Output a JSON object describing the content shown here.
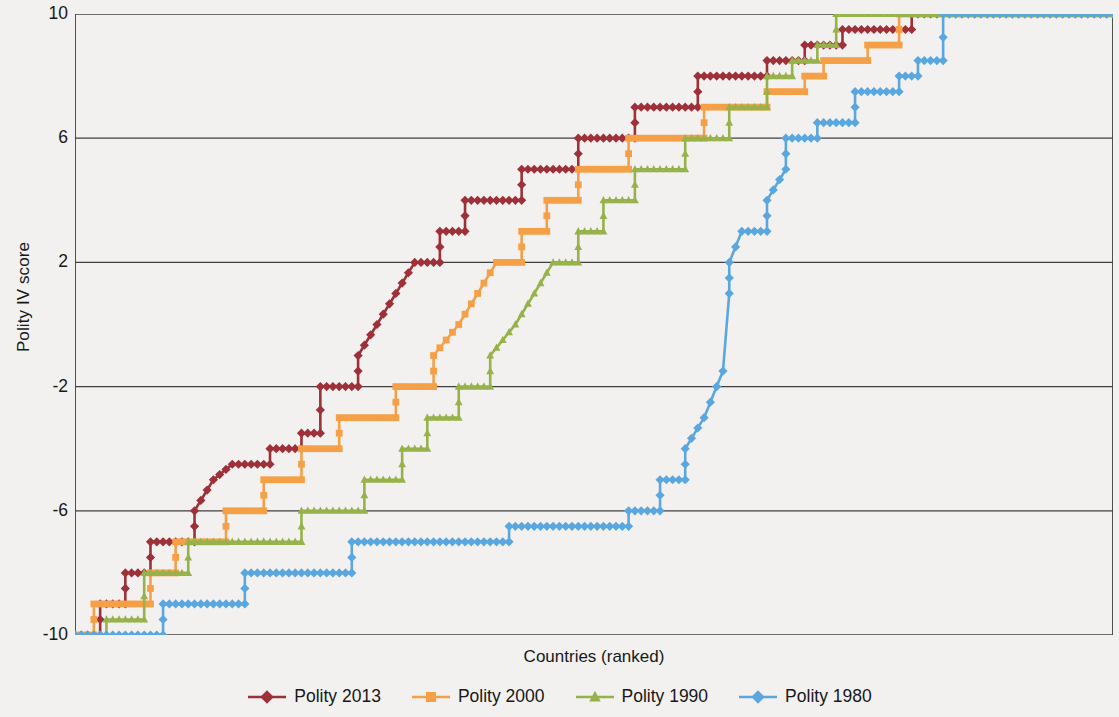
{
  "chart_data": {
    "type": "line",
    "title": "",
    "xlabel": "Countries (ranked)",
    "ylabel": "Polity IV score",
    "ylim": [
      -10,
      10
    ],
    "yticks": [
      10,
      6,
      2,
      -2,
      -6,
      -10
    ],
    "ytick_labels": [
      "10",
      "6",
      "2",
      "-2",
      "-6",
      "-10"
    ],
    "xlim": [
      0,
      165
    ],
    "xticks": [],
    "xtick_labels": [],
    "grid": "horizontal",
    "legend_position": "bottom",
    "note": "Each series is a sorted (ranked) distribution of Polity IV scores across countries; curves are monotonically increasing step functions from -10 to +10.",
    "series": [
      {
        "name": "Polity 2013",
        "color": "#9e3039",
        "marker": "diamond",
        "steps": [
          {
            "x": 0,
            "y": -10
          },
          {
            "x": 4,
            "y": -10
          },
          {
            "x": 4,
            "y": -9
          },
          {
            "x": 8,
            "y": -9
          },
          {
            "x": 8,
            "y": -8
          },
          {
            "x": 12,
            "y": -8
          },
          {
            "x": 12,
            "y": -7
          },
          {
            "x": 19,
            "y": -7
          },
          {
            "x": 19,
            "y": -6
          },
          {
            "x": 22,
            "y": -5
          },
          {
            "x": 25,
            "y": -4.5
          },
          {
            "x": 31,
            "y": -4.5
          },
          {
            "x": 31,
            "y": -4
          },
          {
            "x": 36,
            "y": -4
          },
          {
            "x": 36,
            "y": -3.5
          },
          {
            "x": 39,
            "y": -3.5
          },
          {
            "x": 39,
            "y": -2
          },
          {
            "x": 45,
            "y": -2
          },
          {
            "x": 45,
            "y": -1
          },
          {
            "x": 48,
            "y": 0
          },
          {
            "x": 51,
            "y": 1
          },
          {
            "x": 54,
            "y": 2
          },
          {
            "x": 58,
            "y": 2
          },
          {
            "x": 58,
            "y": 3
          },
          {
            "x": 62,
            "y": 3
          },
          {
            "x": 62,
            "y": 4
          },
          {
            "x": 71,
            "y": 4
          },
          {
            "x": 71,
            "y": 5
          },
          {
            "x": 80,
            "y": 5
          },
          {
            "x": 80,
            "y": 6
          },
          {
            "x": 89,
            "y": 6
          },
          {
            "x": 89,
            "y": 7
          },
          {
            "x": 99,
            "y": 7
          },
          {
            "x": 99,
            "y": 8
          },
          {
            "x": 110,
            "y": 8
          },
          {
            "x": 110,
            "y": 8.5
          },
          {
            "x": 116,
            "y": 8.5
          },
          {
            "x": 116,
            "y": 9
          },
          {
            "x": 122,
            "y": 9
          },
          {
            "x": 122,
            "y": 9.5
          },
          {
            "x": 133,
            "y": 9.5
          },
          {
            "x": 133,
            "y": 10
          },
          {
            "x": 165,
            "y": 10
          }
        ]
      },
      {
        "name": "Polity 2000",
        "color": "#f5a046",
        "marker": "square",
        "steps": [
          {
            "x": 0,
            "y": -10
          },
          {
            "x": 3,
            "y": -10
          },
          {
            "x": 3,
            "y": -9
          },
          {
            "x": 12,
            "y": -9
          },
          {
            "x": 12,
            "y": -8
          },
          {
            "x": 16,
            "y": -8
          },
          {
            "x": 16,
            "y": -7
          },
          {
            "x": 24,
            "y": -7
          },
          {
            "x": 24,
            "y": -6
          },
          {
            "x": 30,
            "y": -6
          },
          {
            "x": 30,
            "y": -5
          },
          {
            "x": 36,
            "y": -5
          },
          {
            "x": 36,
            "y": -4
          },
          {
            "x": 42,
            "y": -4
          },
          {
            "x": 42,
            "y": -3
          },
          {
            "x": 51,
            "y": -3
          },
          {
            "x": 51,
            "y": -2
          },
          {
            "x": 57,
            "y": -2
          },
          {
            "x": 57,
            "y": -1
          },
          {
            "x": 61,
            "y": 0
          },
          {
            "x": 64,
            "y": 1
          },
          {
            "x": 67,
            "y": 2
          },
          {
            "x": 71,
            "y": 2
          },
          {
            "x": 71,
            "y": 3
          },
          {
            "x": 75,
            "y": 3
          },
          {
            "x": 75,
            "y": 4
          },
          {
            "x": 80,
            "y": 4
          },
          {
            "x": 80,
            "y": 5
          },
          {
            "x": 88,
            "y": 5
          },
          {
            "x": 88,
            "y": 6
          },
          {
            "x": 100,
            "y": 6
          },
          {
            "x": 100,
            "y": 7
          },
          {
            "x": 110,
            "y": 7
          },
          {
            "x": 110,
            "y": 7.5
          },
          {
            "x": 116,
            "y": 7.5
          },
          {
            "x": 116,
            "y": 8
          },
          {
            "x": 119,
            "y": 8
          },
          {
            "x": 119,
            "y": 8.5
          },
          {
            "x": 126,
            "y": 8.5
          },
          {
            "x": 126,
            "y": 9
          },
          {
            "x": 131,
            "y": 9
          },
          {
            "x": 131,
            "y": 10
          },
          {
            "x": 165,
            "y": 10
          }
        ]
      },
      {
        "name": "Polity 1990",
        "color": "#97b24b",
        "marker": "triangle",
        "steps": [
          {
            "x": 0,
            "y": -10
          },
          {
            "x": 5,
            "y": -10
          },
          {
            "x": 5,
            "y": -9.5
          },
          {
            "x": 11,
            "y": -9.5
          },
          {
            "x": 11,
            "y": -8
          },
          {
            "x": 18,
            "y": -8
          },
          {
            "x": 18,
            "y": -7
          },
          {
            "x": 30,
            "y": -7
          },
          {
            "x": 30,
            "y": -7
          },
          {
            "x": 36,
            "y": -7
          },
          {
            "x": 36,
            "y": -6
          },
          {
            "x": 46,
            "y": -6
          },
          {
            "x": 46,
            "y": -5
          },
          {
            "x": 52,
            "y": -5
          },
          {
            "x": 52,
            "y": -4
          },
          {
            "x": 56,
            "y": -4
          },
          {
            "x": 56,
            "y": -3
          },
          {
            "x": 61,
            "y": -3
          },
          {
            "x": 61,
            "y": -2
          },
          {
            "x": 66,
            "y": -2
          },
          {
            "x": 66,
            "y": -1
          },
          {
            "x": 70,
            "y": 0
          },
          {
            "x": 73,
            "y": 1
          },
          {
            "x": 76,
            "y": 2
          },
          {
            "x": 80,
            "y": 2
          },
          {
            "x": 80,
            "y": 3
          },
          {
            "x": 84,
            "y": 3
          },
          {
            "x": 84,
            "y": 4
          },
          {
            "x": 89,
            "y": 4
          },
          {
            "x": 89,
            "y": 5
          },
          {
            "x": 97,
            "y": 5
          },
          {
            "x": 97,
            "y": 6
          },
          {
            "x": 104,
            "y": 6
          },
          {
            "x": 104,
            "y": 7
          },
          {
            "x": 110,
            "y": 7
          },
          {
            "x": 110,
            "y": 8
          },
          {
            "x": 114,
            "y": 8
          },
          {
            "x": 114,
            "y": 8.5
          },
          {
            "x": 118,
            "y": 8.5
          },
          {
            "x": 118,
            "y": 9
          },
          {
            "x": 121,
            "y": 9
          },
          {
            "x": 121,
            "y": 10
          },
          {
            "x": 165,
            "y": 10
          }
        ]
      },
      {
        "name": "Polity 1980",
        "color": "#5aa7e0",
        "marker": "diamond",
        "steps": [
          {
            "x": 0,
            "y": -10
          },
          {
            "x": 14,
            "y": -10
          },
          {
            "x": 14,
            "y": -9
          },
          {
            "x": 27,
            "y": -9
          },
          {
            "x": 27,
            "y": -8
          },
          {
            "x": 44,
            "y": -8
          },
          {
            "x": 44,
            "y": -7
          },
          {
            "x": 69,
            "y": -7
          },
          {
            "x": 69,
            "y": -6.5
          },
          {
            "x": 88,
            "y": -6.5
          },
          {
            "x": 88,
            "y": -6
          },
          {
            "x": 93,
            "y": -6
          },
          {
            "x": 93,
            "y": -5
          },
          {
            "x": 97,
            "y": -5
          },
          {
            "x": 97,
            "y": -4
          },
          {
            "x": 100,
            "y": -3
          },
          {
            "x": 102,
            "y": -2
          },
          {
            "x": 103,
            "y": -1.5
          },
          {
            "x": 104,
            "y": 1
          },
          {
            "x": 104,
            "y": 2
          },
          {
            "x": 106,
            "y": 3
          },
          {
            "x": 110,
            "y": 3
          },
          {
            "x": 110,
            "y": 4
          },
          {
            "x": 113,
            "y": 5
          },
          {
            "x": 113,
            "y": 6
          },
          {
            "x": 118,
            "y": 6
          },
          {
            "x": 118,
            "y": 6.5
          },
          {
            "x": 124,
            "y": 6.5
          },
          {
            "x": 124,
            "y": 7.5
          },
          {
            "x": 131,
            "y": 7.5
          },
          {
            "x": 131,
            "y": 8
          },
          {
            "x": 134,
            "y": 8
          },
          {
            "x": 134,
            "y": 8.5
          },
          {
            "x": 138,
            "y": 8.5
          },
          {
            "x": 138,
            "y": 10
          },
          {
            "x": 165,
            "y": 10
          }
        ]
      }
    ]
  },
  "axis": {
    "y_title": "Polity IV score",
    "x_title": "Countries (ranked)",
    "y_labels": [
      "10",
      "6",
      "2",
      "-2",
      "-6",
      "-10"
    ]
  },
  "legend": {
    "items": [
      {
        "label": "Polity 2013",
        "color": "#9e3039",
        "marker": "diamond"
      },
      {
        "label": "Polity 2000",
        "color": "#f5a046",
        "marker": "square"
      },
      {
        "label": "Polity 1990",
        "color": "#97b24b",
        "marker": "triangle"
      },
      {
        "label": "Polity 1980",
        "color": "#5aa7e0",
        "marker": "diamond"
      }
    ]
  },
  "colors": {
    "axis": "#3f3f3f",
    "grid": "#3f3f3f",
    "background": "#f2f1ef",
    "text": "#181818"
  }
}
